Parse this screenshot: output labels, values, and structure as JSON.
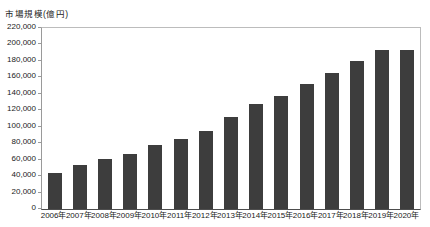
{
  "chart_data": {
    "type": "bar",
    "title": "市場規模(億円)",
    "categories": [
      "2006年",
      "2007年",
      "2008年",
      "2009年",
      "2010年",
      "2011年",
      "2012年",
      "2013年",
      "2014年",
      "2015年",
      "2016年",
      "2017年",
      "2018年",
      "2019年",
      "2020年"
    ],
    "values": [
      44240,
      53440,
      60890,
      66960,
      77880,
      84590,
      95130,
      111660,
      127970,
      137746,
      151358,
      165054,
      179845,
      193609,
      192779
    ],
    "xlabel": "",
    "ylabel": "市場規模(億円)",
    "ylim": [
      0,
      220000
    ],
    "ytick_step": 20000,
    "ytick_labels": [
      "0",
      "20,000",
      "40,000",
      "60,000",
      "80,000",
      "100,000",
      "120,000",
      "140,000",
      "160,000",
      "180,000",
      "200,000",
      "220,000"
    ],
    "grid": false,
    "legend": false,
    "bar_color": "#3d3d3d",
    "plot_border_color": "#bcbcbc",
    "axis_color": "#4d4d4d",
    "text_color": "#1a1a1a",
    "background_color": "#ffffff"
  }
}
